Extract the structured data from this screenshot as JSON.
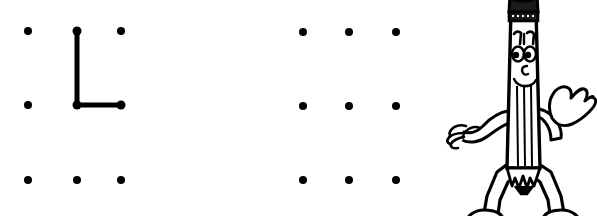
{
  "page": {
    "background_color": "#ffffff",
    "ink_color": "#000000",
    "width": 597,
    "height": 216
  },
  "grids": [
    {
      "name": "grid-left",
      "rows": 3,
      "cols": 3,
      "dot_radius": 4,
      "dot_color": "#000000",
      "dots": [
        {
          "row": 0,
          "col": 0,
          "x": 28,
          "y": 31
        },
        {
          "row": 0,
          "col": 1,
          "x": 77,
          "y": 31
        },
        {
          "row": 0,
          "col": 2,
          "x": 121,
          "y": 31
        },
        {
          "row": 1,
          "col": 0,
          "x": 28,
          "y": 105
        },
        {
          "row": 1,
          "col": 1,
          "x": 77,
          "y": 105
        },
        {
          "row": 1,
          "col": 2,
          "x": 121,
          "y": 105
        },
        {
          "row": 2,
          "col": 0,
          "x": 28,
          "y": 180
        },
        {
          "row": 2,
          "col": 1,
          "x": 77,
          "y": 180
        },
        {
          "row": 2,
          "col": 2,
          "x": 121,
          "y": 180
        }
      ],
      "drawn_shape": {
        "name": "letter-L",
        "label": "L",
        "stroke_width": 5,
        "stroke_color": "#000000",
        "points": [
          {
            "x": 77,
            "y": 31
          },
          {
            "x": 77,
            "y": 105
          },
          {
            "x": 121,
            "y": 105
          }
        ],
        "endpoint_dots": [
          {
            "x": 77,
            "y": 31
          },
          {
            "x": 77,
            "y": 105
          },
          {
            "x": 121,
            "y": 105
          }
        ]
      }
    },
    {
      "name": "grid-right",
      "rows": 3,
      "cols": 3,
      "dot_radius": 4,
      "dot_color": "#000000",
      "dots": [
        {
          "row": 0,
          "col": 0,
          "x": 303,
          "y": 32
        },
        {
          "row": 0,
          "col": 1,
          "x": 349,
          "y": 32
        },
        {
          "row": 0,
          "col": 2,
          "x": 396,
          "y": 32
        },
        {
          "row": 1,
          "col": 0,
          "x": 303,
          "y": 106
        },
        {
          "row": 1,
          "col": 1,
          "x": 349,
          "y": 106
        },
        {
          "row": 1,
          "col": 2,
          "x": 396,
          "y": 106
        },
        {
          "row": 2,
          "col": 0,
          "x": 303,
          "y": 180
        },
        {
          "row": 2,
          "col": 1,
          "x": 349,
          "y": 180
        },
        {
          "row": 2,
          "col": 2,
          "x": 396,
          "y": 180
        }
      ],
      "drawn_shape": null
    }
  ],
  "mascot": {
    "name": "pencil-character",
    "description": "Smiling cartoon pencil with arms, legs, eraser top and sharpened tip",
    "outline_color": "#000000",
    "fill_color": "#ffffff",
    "eraser_color": "#1a1a1a",
    "position": {
      "x": 440,
      "y": 0,
      "width": 157,
      "height": 216
    },
    "parts": [
      "eraser-top",
      "ferrule-band",
      "eyebrows",
      "eyes",
      "nose",
      "smile",
      "body",
      "wood-grain-lines",
      "left-arm",
      "left-hand",
      "right-arm",
      "waving-hand",
      "legs",
      "feet",
      "pencil-tip"
    ],
    "gesture": "waving"
  }
}
